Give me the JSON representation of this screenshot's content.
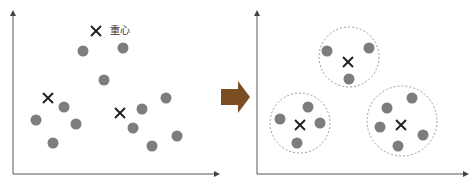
{
  "diagram": {
    "centroid_label": "重心",
    "colors": {
      "point": "#7d7d7d",
      "centroid": "#222222",
      "axis": "#555555",
      "cluster_outline": "#9a9a9a",
      "arrow": "#7a4e22"
    },
    "before": {
      "centroids": [
        {
          "x": 96,
          "y": 31,
          "label": "重心"
        },
        {
          "x": 48,
          "y": 98
        },
        {
          "x": 120,
          "y": 113
        }
      ],
      "points": [
        {
          "x": 83,
          "y": 51
        },
        {
          "x": 123,
          "y": 48
        },
        {
          "x": 104,
          "y": 80
        },
        {
          "x": 64,
          "y": 107
        },
        {
          "x": 36,
          "y": 120
        },
        {
          "x": 76,
          "y": 124
        },
        {
          "x": 53,
          "y": 143
        },
        {
          "x": 166,
          "y": 98
        },
        {
          "x": 142,
          "y": 109
        },
        {
          "x": 133,
          "y": 128
        },
        {
          "x": 177,
          "y": 136
        },
        {
          "x": 152,
          "y": 146
        }
      ]
    },
    "after": {
      "clusters": [
        {
          "cx": 349,
          "cy": 57,
          "r": 30,
          "centroid": {
            "x": 348,
            "y": 62
          },
          "points": [
            {
              "x": 327,
              "y": 51
            },
            {
              "x": 369,
              "y": 48
            },
            {
              "x": 349,
              "y": 79
            }
          ]
        },
        {
          "cx": 300,
          "cy": 123,
          "r": 30,
          "centroid": {
            "x": 300,
            "y": 125
          },
          "points": [
            {
              "x": 280,
              "y": 119
            },
            {
              "x": 308,
              "y": 107
            },
            {
              "x": 320,
              "y": 123
            },
            {
              "x": 297,
              "y": 143
            }
          ]
        },
        {
          "cx": 402,
          "cy": 121,
          "r": 35,
          "centroid": {
            "x": 401,
            "y": 125
          },
          "points": [
            {
              "x": 412,
              "y": 98
            },
            {
              "x": 387,
              "y": 108
            },
            {
              "x": 380,
              "y": 127
            },
            {
              "x": 423,
              "y": 135
            },
            {
              "x": 398,
              "y": 146
            }
          ]
        }
      ]
    },
    "transition_arrow": {
      "direction": "right"
    }
  }
}
